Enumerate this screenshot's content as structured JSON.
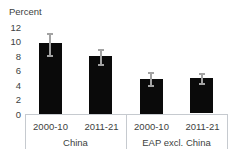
{
  "chart_data": {
    "type": "bar",
    "title": "",
    "ylabel": "Percent",
    "xlabel": "",
    "ylim": [
      0,
      12
    ],
    "yticks": [
      0,
      2,
      4,
      6,
      8,
      10,
      12
    ],
    "grid": false,
    "legend": "none",
    "bar_color": "#0a0a0a",
    "error_bar_color": "#a3a3a3",
    "axis_line_color": "#c6cacf",
    "text_color": "#3d3f41",
    "groups": [
      {
        "label": "China",
        "bars": [
          {
            "category": "2000-10",
            "value": 9.8,
            "err_low": 8.0,
            "err_high": 11.1
          },
          {
            "category": "2011-21",
            "value": 8.0,
            "err_low": 6.7,
            "err_high": 8.9
          }
        ]
      },
      {
        "label": "EAP excl. China",
        "bars": [
          {
            "category": "2000-10",
            "value": 4.8,
            "err_low": 3.8,
            "err_high": 5.7
          },
          {
            "category": "2011-21",
            "value": 4.9,
            "err_low": 4.1,
            "err_high": 5.6
          }
        ]
      }
    ]
  }
}
